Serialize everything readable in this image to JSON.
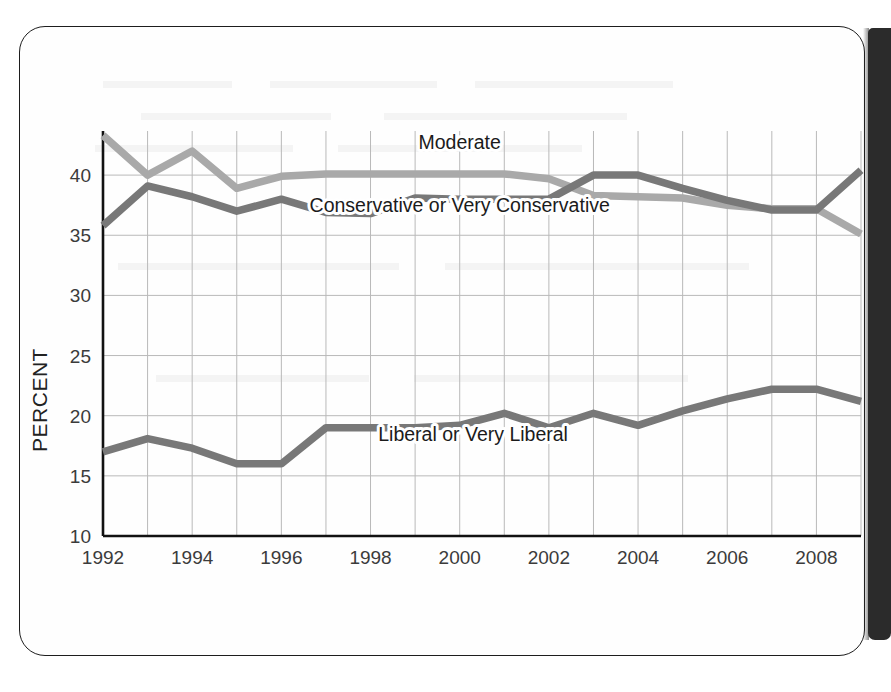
{
  "page": {
    "sheet_label": "scanned-book-page",
    "spine_label": "book-gutter-shadow"
  },
  "chart_data": {
    "type": "line",
    "title": "",
    "xlabel": "",
    "ylabel": "PERCENT",
    "xlim": [
      1992,
      2009
    ],
    "ylim": [
      10,
      43.5
    ],
    "yticks": [
      10,
      15,
      20,
      25,
      30,
      35,
      40
    ],
    "ytick_labels": [
      "10",
      "15",
      "20",
      "25",
      "30",
      "35",
      "40"
    ],
    "xticks": [
      1992,
      1994,
      1996,
      1998,
      2000,
      2002,
      2004,
      2006,
      2008
    ],
    "xtick_labels": [
      "1992",
      "1994",
      "1996",
      "1998",
      "2000",
      "2002",
      "2004",
      "2006",
      "2008"
    ],
    "gridlines": "both",
    "grid_x_every": 1,
    "legend": "inline-annotations",
    "x": [
      1992,
      1993,
      1994,
      1995,
      1996,
      1997,
      1998,
      1999,
      2000,
      2001,
      2002,
      2003,
      2004,
      2005,
      2006,
      2007,
      2008,
      2009
    ],
    "series": [
      {
        "name": "Moderate",
        "color": "#a9a9a9",
        "label_x": 2000.0,
        "label_y": 42.2,
        "values": [
          43.3,
          40.0,
          42.0,
          38.9,
          39.9,
          40.1,
          40.1,
          40.1,
          40.1,
          40.1,
          39.7,
          38.3,
          38.2,
          38.1,
          37.5,
          37.2,
          37.2,
          35.1
        ]
      },
      {
        "name": "Conservative or Very Conservative",
        "color": "#787878",
        "label_x": 2000.0,
        "label_y": 36.9,
        "values": [
          35.8,
          39.1,
          38.2,
          37.0,
          38.0,
          36.9,
          36.8,
          38.1,
          38.0,
          38.0,
          38.0,
          40.0,
          40.0,
          38.9,
          37.9,
          37.1,
          37.1,
          40.4
        ]
      },
      {
        "name": "Liberal or Very Liberal",
        "color": "#787878",
        "label_x": 2000.3,
        "label_y": 17.9,
        "values": [
          17.0,
          18.1,
          17.3,
          16.0,
          16.0,
          19.0,
          19.0,
          19.0,
          19.2,
          20.2,
          19.0,
          20.2,
          19.2,
          20.4,
          21.4,
          22.2,
          22.2,
          21.2
        ]
      }
    ]
  }
}
